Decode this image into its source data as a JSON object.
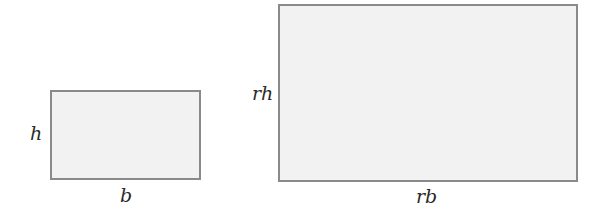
{
  "diagram": {
    "small_rectangle": {
      "height_label": "h",
      "base_label": "b"
    },
    "large_rectangle": {
      "height_label": "rh",
      "base_label": "rb"
    },
    "colors": {
      "fill": "#f2f2f2",
      "stroke": "#8a8a8a",
      "text": "#2a2a2a"
    }
  }
}
